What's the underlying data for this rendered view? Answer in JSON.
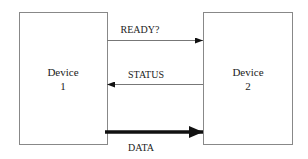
{
  "diagram": {
    "devices": [
      {
        "id": "device-1",
        "line1": "Device",
        "line2": "1"
      },
      {
        "id": "device-2",
        "line1": "Device",
        "line2": "2"
      }
    ],
    "signals": [
      {
        "label": "READY?",
        "direction": "device-1 to device-2",
        "weight": "thin"
      },
      {
        "label": "STATUS",
        "direction": "device-2 to device-1",
        "weight": "thin"
      },
      {
        "label": "DATA",
        "direction": "device-1 to device-2",
        "weight": "thick"
      }
    ]
  }
}
